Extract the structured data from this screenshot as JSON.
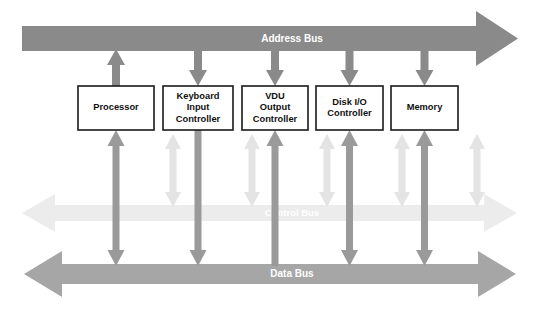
{
  "diagram": {
    "background_color": "#ffffff",
    "colors": {
      "address_bus": "#8a8a8a",
      "data_bus": "#a6a6a6",
      "control_bus": "#ececec",
      "address_connector": "#8a8a8a",
      "data_connector": "#9a9a9a",
      "control_connector": "#e4e4e4",
      "box_border": "#1a1a1a",
      "box_fill": "#ffffff",
      "box_text": "#111111",
      "bus_label_text": "#ffffff"
    }
  },
  "buses": [
    {
      "id": "address-bus",
      "label": "Address Bus",
      "direction": "right",
      "color": "#8a8a8a",
      "y": 38
    },
    {
      "id": "control-bus",
      "label": "Control Bus",
      "direction": "both",
      "color": "#ececec",
      "y": 213
    },
    {
      "id": "data-bus",
      "label": "Data Bus",
      "direction": "both",
      "color": "#a6a6a6",
      "y": 274
    }
  ],
  "units": [
    {
      "id": "processor",
      "lines": [
        "Processor"
      ],
      "x": 78,
      "width": 76,
      "address_arrow": "up",
      "control_arrow": "both",
      "data_arrow": "both"
    },
    {
      "id": "keyboard-input-controller",
      "lines": [
        "Keyboard",
        "Input",
        "Controller"
      ],
      "x": 163,
      "width": 70,
      "address_arrow": "down",
      "control_arrow": "both",
      "data_arrow": "down"
    },
    {
      "id": "vdu-output-controller",
      "lines": [
        "VDU",
        "Output",
        "Controller"
      ],
      "x": 242,
      "width": 66,
      "address_arrow": "down",
      "control_arrow": "both",
      "data_arrow": "up"
    },
    {
      "id": "disk-io-controller",
      "lines": [
        "Disk I/O",
        "Controller"
      ],
      "x": 316,
      "width": 67,
      "address_arrow": "down",
      "control_arrow": "both",
      "data_arrow": "both"
    },
    {
      "id": "memory",
      "lines": [
        "Memory"
      ],
      "x": 391,
      "width": 67,
      "address_arrow": "down",
      "control_arrow": "both",
      "data_arrow": "both"
    }
  ]
}
